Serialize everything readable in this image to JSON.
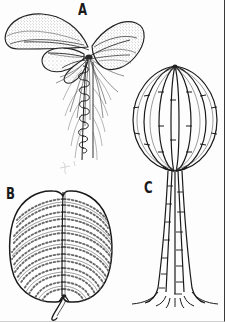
{
  "plate": {
    "title": "",
    "background_color": "#fdfdfd",
    "ink_color": "#1d1d1d",
    "width": 225,
    "height": 322,
    "style": "black-and-white stippled line drawing",
    "subject": "botanical / morphological illustration plate with three lettered figures"
  },
  "figures": [
    {
      "id": "A",
      "label": "A",
      "label_position": {
        "x": 78,
        "y": 3
      },
      "caption": "",
      "description": "whole plant with broad stippled leaves radiating from an apex atop a slender coiled stem bearing fine filamentous rootlets"
    },
    {
      "id": "B",
      "label": "B",
      "label_position": {
        "x": 6,
        "y": 187
      },
      "caption": "",
      "description": "broad ovate leaf blade in surface view showing a central midrib, arching lateral veins and rows of small circular cells, with a short hooked petiole at the base"
    },
    {
      "id": "C",
      "label": "C",
      "label_position": {
        "x": 144,
        "y": 181
      },
      "caption": "",
      "description": "lantern- or globe-shaped crown of segmented ribs converging at top and bottom, borne on a jointed trunk that flares into spreading basal roots"
    }
  ]
}
